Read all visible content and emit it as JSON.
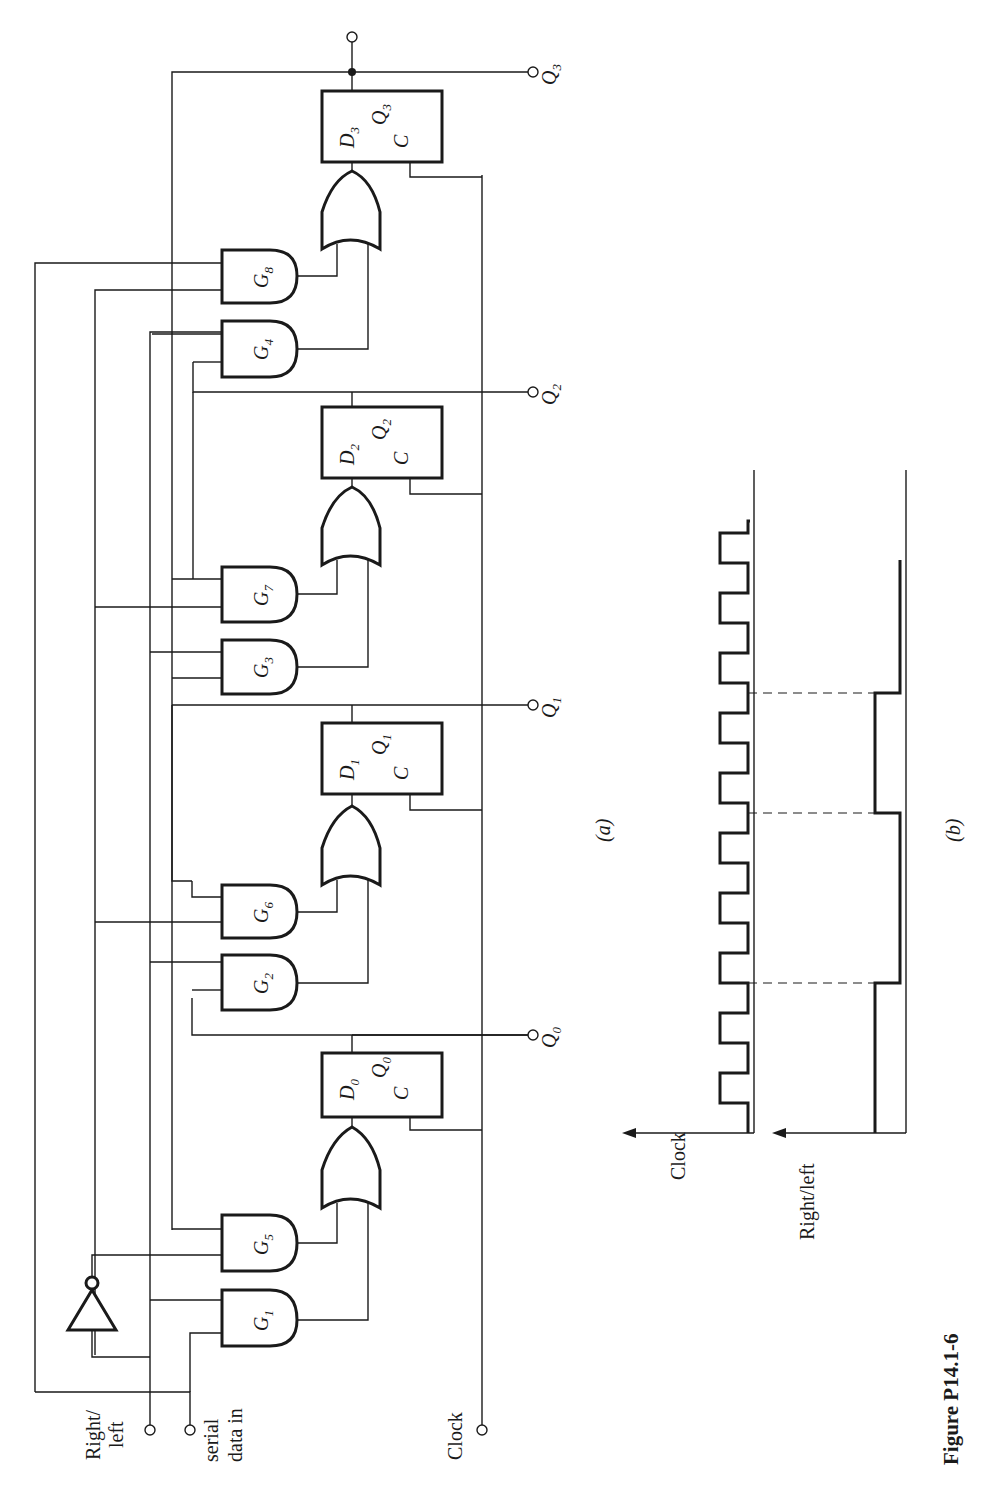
{
  "figure": {
    "caption": "Figure P14.1-6",
    "part_a_label": "(a)",
    "part_b_label": "(b)",
    "page_number": "624"
  },
  "inputs": {
    "right_left_line1": "Right/",
    "right_left_line2": "left",
    "serial_line1": "serial",
    "serial_line2": "data in",
    "clock": "Clock"
  },
  "gates": [
    {
      "id": "G1",
      "letter": "G",
      "sub": "1"
    },
    {
      "id": "G2",
      "letter": "G",
      "sub": "2"
    },
    {
      "id": "G3",
      "letter": "G",
      "sub": "3"
    },
    {
      "id": "G4",
      "letter": "G",
      "sub": "4"
    },
    {
      "id": "G5",
      "letter": "G",
      "sub": "5"
    },
    {
      "id": "G6",
      "letter": "G",
      "sub": "6"
    },
    {
      "id": "G7",
      "letter": "G",
      "sub": "7"
    },
    {
      "id": "G8",
      "letter": "G",
      "sub": "8"
    }
  ],
  "flipflops": [
    {
      "d": "D",
      "q": "Q",
      "c": "C",
      "sub": "0"
    },
    {
      "d": "D",
      "q": "Q",
      "c": "C",
      "sub": "1"
    },
    {
      "d": "D",
      "q": "Q",
      "c": "C",
      "sub": "2"
    },
    {
      "d": "D",
      "q": "Q",
      "c": "C",
      "sub": "3"
    }
  ],
  "outputs": [
    {
      "letter": "Q",
      "sub": "0"
    },
    {
      "letter": "Q",
      "sub": "1"
    },
    {
      "letter": "Q",
      "sub": "2"
    },
    {
      "letter": "Q",
      "sub": "3"
    }
  ],
  "timing": {
    "clock_label": "Clock",
    "right_left_label": "Right/left",
    "clock_pulses": 12,
    "right_left_transitions_at_pulse": [
      3,
      7,
      10
    ]
  }
}
